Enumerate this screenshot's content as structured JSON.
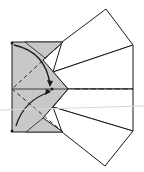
{
  "diagram": {
    "type": "origami-fold-step",
    "colors": {
      "paper_gray": "#c8c8c8",
      "paper_white": "#ffffff",
      "line": "#1a1a1a"
    },
    "arrows": [
      {
        "name": "upper-fold-arrow",
        "direction": "top-left corner to center"
      },
      {
        "name": "lower-fold-arrow",
        "direction": "bottom-left corner to center"
      }
    ]
  }
}
